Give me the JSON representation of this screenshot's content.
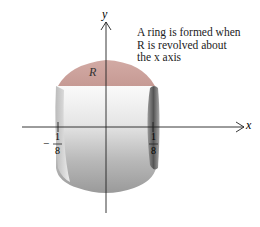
{
  "diagram": {
    "caption_lines": [
      "A ring is formed when",
      "R is revolved about",
      "the x axis"
    ],
    "axis_labels": {
      "x": "x",
      "y": "y"
    },
    "region_label": "R",
    "tick_labels": {
      "left": {
        "sign": "−",
        "numerator": "1",
        "denominator": "8"
      },
      "right": {
        "numerator": "1",
        "denominator": "8"
      }
    },
    "colors": {
      "region_fill": "#c9a09a",
      "ring_light": "#f4f4f4",
      "ring_dark": "#8a8a8a",
      "axis": "#222222"
    }
  }
}
